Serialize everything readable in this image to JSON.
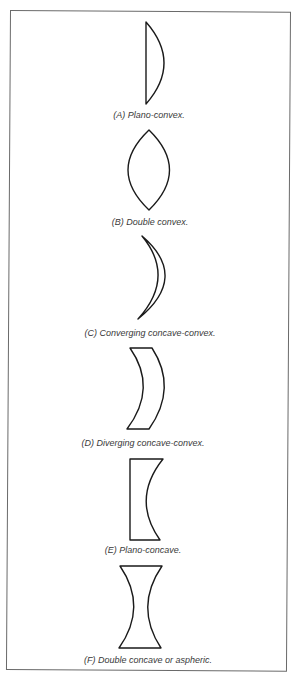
{
  "figure": {
    "lenses": [
      {
        "id": "A",
        "caption": "(A)  Plano-convex."
      },
      {
        "id": "B",
        "caption": "(B)  Double convex."
      },
      {
        "id": "C",
        "caption": "(C)  Converging concave-convex."
      },
      {
        "id": "D",
        "caption": "(D)  Diverging concave-convex."
      },
      {
        "id": "E",
        "caption": "(E)  Plano-concave."
      },
      {
        "id": "F",
        "caption": "(F)  Double concave or aspheric."
      }
    ],
    "colors": {
      "stroke": "#1a1a1a",
      "border": "#6a6a6a",
      "text": "#3a3a3a"
    }
  }
}
